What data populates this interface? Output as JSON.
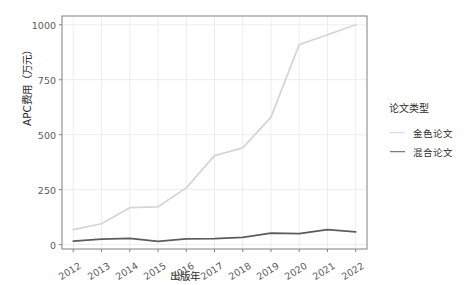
{
  "chart_data": {
    "type": "line",
    "title": "",
    "xlabel": "出版年",
    "ylabel": "APC费用（万元）",
    "x": [
      2012,
      2013,
      2014,
      2015,
      2016,
      2017,
      2018,
      2019,
      2020,
      2021,
      2022
    ],
    "xtick_labels": [
      "2012",
      "2013",
      "2014",
      "2015",
      "2016",
      "2017",
      "2018",
      "2019",
      "2020",
      "2021",
      "2022"
    ],
    "ytick_labels": [
      "0",
      "250",
      "500",
      "750",
      "1000"
    ],
    "yticks": [
      0,
      250,
      500,
      750,
      1000
    ],
    "ylim": [
      -20,
      1040
    ],
    "xlim": [
      2011.6,
      2022.4
    ],
    "grid": true,
    "legend_position": "right",
    "legend_title": "论文类型",
    "series": [
      {
        "name": "金色论文",
        "color": "#d5d5d5",
        "values": [
          68,
          95,
          168,
          172,
          258,
          405,
          440,
          580,
          910,
          955,
          1000
        ]
      },
      {
        "name": "混合论文",
        "color": "#5c5c5c",
        "values": [
          16,
          25,
          28,
          15,
          26,
          27,
          33,
          52,
          50,
          68,
          58
        ]
      }
    ]
  },
  "panel": {
    "background": "#ffffff",
    "border_color": "#808080",
    "grid_color": "#ededed"
  },
  "axis": {
    "tick_color": "#808080",
    "text_color": "#5a5a5a"
  }
}
